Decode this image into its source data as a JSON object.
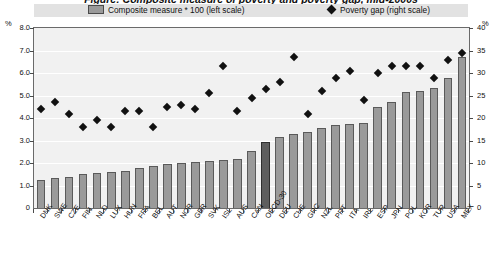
{
  "title_partial": "Figure: Composite measure of poverty and poverty gap, mid-2000s",
  "legend": {
    "series1_label": "Composite measure * 100 (left scale)",
    "series2_label": "Poverty gap (right scale)",
    "series1_icon": "square-swatch-icon",
    "series2_icon": "diamond-marker-icon"
  },
  "axes": {
    "left_unit": "%",
    "right_unit": "%",
    "left_ticks": [
      "0",
      "1.0",
      "2.0",
      "3.0",
      "4.0",
      "5.0",
      "6.0",
      "7.0",
      "8.0"
    ],
    "right_ticks": [
      "0",
      "5",
      "10",
      "15",
      "20",
      "25",
      "30",
      "35",
      "40"
    ]
  },
  "colors": {
    "bar_fill": "#9a9a9a",
    "bar_highlight": "#5e5e5e",
    "marker": "#111111",
    "plot_bg": "#f1f1f1",
    "legend_bg": "#e2e2e2"
  },
  "chart_data": {
    "type": "bar",
    "title": "Composite measure of poverty and poverty gap",
    "xlabel": "",
    "ylabel": "%",
    "ylim": [
      0,
      8
    ],
    "y2lim": [
      0,
      40
    ],
    "grid": true,
    "legend_position": "top",
    "categories": [
      "DNK",
      "SWE",
      "CZE",
      "FIN",
      "NLD",
      "LUX",
      "HUN",
      "FRA",
      "BEL",
      "AUT",
      "NOR",
      "GBR",
      "SVK",
      "ISL",
      "AUS",
      "CAN",
      "OECD-30",
      "DEU",
      "CHE",
      "GRC",
      "NZL",
      "PRT",
      "ITA",
      "IRL",
      "ESP",
      "JPN",
      "POL",
      "KOR",
      "TUR",
      "USA",
      "MEX"
    ],
    "highlight_category": "OECD-30",
    "series": [
      {
        "name": "Composite measure * 100 (left scale)",
        "axis": "left",
        "type": "bar",
        "values": [
          1.25,
          1.35,
          1.4,
          1.5,
          1.55,
          1.6,
          1.65,
          1.8,
          1.85,
          1.95,
          2.0,
          2.05,
          2.1,
          2.15,
          2.2,
          2.55,
          2.95,
          3.15,
          3.3,
          3.4,
          3.55,
          3.7,
          3.75,
          3.8,
          4.5,
          4.7,
          5.15,
          5.2,
          5.35,
          5.8,
          6.7
        ]
      },
      {
        "name": "Poverty gap (right scale)",
        "axis": "right",
        "type": "scatter",
        "values": [
          22.0,
          23.5,
          21.0,
          18.0,
          19.5,
          18.0,
          21.5,
          21.5,
          18.0,
          22.5,
          23.0,
          22.0,
          25.5,
          31.5,
          21.5,
          24.5,
          26.5,
          28.0,
          33.5,
          21.0,
          26.0,
          29.0,
          30.5,
          24.0,
          30.0,
          31.5,
          31.5,
          31.5,
          29.0,
          33.0,
          34.5
        ]
      }
    ]
  }
}
